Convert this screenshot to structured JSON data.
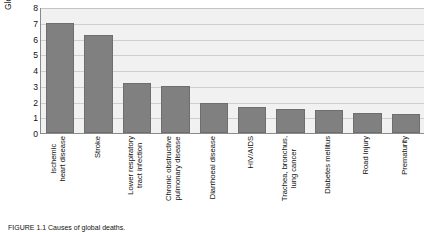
{
  "chart_data": {
    "type": "bar",
    "title": "",
    "xlabel": "",
    "ylabel": "Global deaths (millions)",
    "ylim": [
      0,
      8
    ],
    "yticks": [
      0,
      1,
      2,
      3,
      4,
      5,
      6,
      7,
      8
    ],
    "grid": true,
    "legend": "none",
    "bar_color": "#808080",
    "plot_background": "#f1f1f1",
    "categories": [
      "Ischemic heart disease",
      "Stroke",
      "Lower respiratory tract infection",
      "Chronic obstructive pulmonary disease",
      "Diarrhoeal disease",
      "HIV/AIDS",
      "Trachea, bronchus, lung cancer",
      "Diabetes mellitus",
      "Road injury",
      "Prematurity"
    ],
    "category_lines": [
      [
        "Ischemic",
        "heart disease"
      ],
      [
        "Stroke",
        ""
      ],
      [
        "Lower respiratory",
        "tract infection"
      ],
      [
        "Chronic obstructive",
        "pulmonary disease"
      ],
      [
        "Diarrhoeal disease",
        ""
      ],
      [
        "HIV/AIDS",
        ""
      ],
      [
        "Trachea, bronchus,",
        "lung cancer"
      ],
      [
        "Diabetes mellitus",
        ""
      ],
      [
        "Road injury",
        ""
      ],
      [
        "Prematurity",
        ""
      ]
    ],
    "values": [
      7.0,
      6.2,
      3.2,
      3.0,
      1.9,
      1.65,
      1.55,
      1.45,
      1.3,
      1.2
    ]
  },
  "caption": {
    "text": "FIGURE 1.1   Causes of global deaths."
  }
}
